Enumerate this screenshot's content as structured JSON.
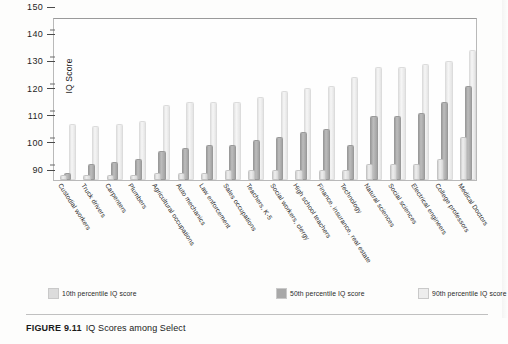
{
  "caption": {
    "figure_number": "FIGURE 9.11",
    "text": "IQ Scores among Select"
  },
  "legend": {
    "items": [
      {
        "label": "10th percentile IQ score",
        "color": "#dcdcdc"
      },
      {
        "label": "50th percentile IQ score",
        "color": "#a8a8a8"
      },
      {
        "label": "90th percentile IQ score",
        "color": "#ededed"
      }
    ]
  },
  "axis": {
    "y_title": "IQ Score",
    "y_major_ticks": [
      "90",
      "100",
      "110",
      "120",
      "130",
      "140",
      "150"
    ],
    "y_minor_count_between": 1
  },
  "chart_data": {
    "type": "bar",
    "title": "IQ Scores among Select",
    "xlabel": "",
    "ylabel": "IQ Score",
    "ylim": [
      90,
      150
    ],
    "ytick_step": 10,
    "grid": false,
    "legend_position": "bottom",
    "categories": [
      "Custodial workers",
      "Truck drivers",
      "Carpenters",
      "Plumbers",
      "Agricultural occupations",
      "Auto mechanics",
      "Law enforcement",
      "Sales occupations",
      "Teachers, K-5",
      "Social workers, clergy",
      "High school teachers",
      "Finance, insurance, real estate",
      "Technology",
      "Natural sciences",
      "Social sciences",
      "Electrical engineers",
      "College professors",
      "Medical Doctors"
    ],
    "series": [
      {
        "name": "10th percentile IQ score",
        "color": "#dcdcdc",
        "values": [
          91,
          91,
          91,
          91,
          92,
          92,
          92,
          93,
          93,
          93,
          93,
          93,
          93,
          95,
          95,
          95,
          97,
          105
        ]
      },
      {
        "name": "50th percentile IQ score",
        "color": "#a8a8a8",
        "values": [
          92,
          95,
          96,
          97,
          100,
          101,
          102,
          102,
          104,
          105,
          107,
          108,
          102,
          113,
          113,
          114,
          118,
          124
        ]
      },
      {
        "name": "90th percentile IQ score",
        "color": "#ededed",
        "values": [
          110,
          109,
          110,
          111,
          117,
          118,
          118,
          118,
          120,
          122,
          123,
          124,
          127,
          131,
          131,
          132,
          133,
          137
        ]
      }
    ]
  }
}
